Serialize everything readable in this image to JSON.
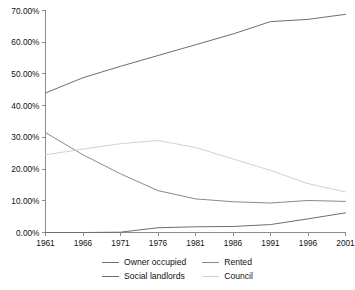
{
  "chart_data": {
    "type": "line",
    "title": "",
    "subtitle": "",
    "xlabel": "",
    "ylabel": "",
    "x": [
      1961,
      1966,
      1971,
      1976,
      1981,
      1986,
      1991,
      1996,
      2001
    ],
    "categories": [
      "1961",
      "1966",
      "1971",
      "1976",
      "1981",
      "1986",
      "1991",
      "1996",
      "2001"
    ],
    "xlim": [
      1961,
      2001
    ],
    "ylim": [
      0,
      70
    ],
    "ytick_values": [
      0,
      10,
      20,
      30,
      40,
      50,
      60,
      70
    ],
    "ytick_labels": [
      "0.00%",
      "10.00%",
      "20.00%",
      "30.00%",
      "40.00%",
      "50.00%",
      "60.00%",
      "70.00%"
    ],
    "xtick_labels": [
      "1961",
      "1966",
      "1971",
      "1976",
      "1981",
      "1986",
      "1991",
      "1996",
      "2001"
    ],
    "grid": false,
    "legend_position": "bottom",
    "series": [
      {
        "name": "Owner occupied",
        "color": "#6e6e6e",
        "values": [
          44.0,
          48.8,
          52.4,
          55.8,
          59.2,
          62.6,
          66.5,
          67.2,
          68.8
        ]
      },
      {
        "name": "Rented",
        "color": "#8a8a8a",
        "values": [
          31.5,
          24.5,
          18.5,
          13.2,
          10.6,
          9.7,
          9.3,
          10.1,
          9.8
        ]
      },
      {
        "name": "Social landlords",
        "color": "#6e6e6e",
        "values": [
          0.0,
          0.0,
          0.1,
          1.5,
          1.8,
          1.9,
          2.5,
          4.3,
          6.2
        ]
      },
      {
        "name": "Council",
        "color": "#d2d2d2",
        "values": [
          24.5,
          26.3,
          28.0,
          29.0,
          26.8,
          23.2,
          19.6,
          15.4,
          12.8
        ]
      }
    ]
  },
  "legend": {
    "entries": [
      {
        "label": "Owner occupied",
        "color": "#6e6e6e"
      },
      {
        "label": "Rented",
        "color": "#8a8a8a"
      },
      {
        "label": "Social landlords",
        "color": "#6e6e6e"
      },
      {
        "label": "Council",
        "color": "#d2d2d2"
      }
    ]
  },
  "axes": {
    "axis_color": "#8c8c8c",
    "background": "#ffffff",
    "text_color": "#111111"
  }
}
